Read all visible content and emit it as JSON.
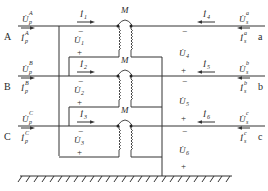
{
  "diagram": {
    "type": "three-phase coupled inductor circuit",
    "colors": {
      "line": "#333333",
      "text": "#2a2a2a",
      "background": "#ffffff"
    },
    "ports_left": [
      {
        "phase": "A",
        "voltage": "U̇",
        "voltage_sub": "p",
        "voltage_sup": "A",
        "current": "İ",
        "current_sub": "p",
        "current_sup": "A"
      },
      {
        "phase": "B",
        "voltage": "U̇",
        "voltage_sub": "p",
        "voltage_sup": "B",
        "current": "İ",
        "current_sub": "p",
        "current_sup": "B"
      },
      {
        "phase": "C",
        "voltage": "U̇",
        "voltage_sub": "p",
        "voltage_sup": "C",
        "current": "İ",
        "current_sub": "p",
        "current_sup": "C"
      }
    ],
    "ports_right": [
      {
        "phase": "a",
        "voltage": "U̇",
        "voltage_sub": "s",
        "voltage_sup": "a",
        "current": "İ",
        "current_sub": "s",
        "current_sup": "a"
      },
      {
        "phase": "b",
        "voltage": "U̇",
        "voltage_sub": "s",
        "voltage_sup": "b",
        "current": "İ",
        "current_sub": "s",
        "current_sup": "b"
      },
      {
        "phase": "c",
        "voltage": "U̇",
        "voltage_sub": "s",
        "voltage_sup": "c",
        "current": "İ",
        "current_sub": "s",
        "current_sup": "c"
      }
    ],
    "branch_currents": [
      {
        "name": "İ",
        "index": "1"
      },
      {
        "name": "İ",
        "index": "2"
      },
      {
        "name": "İ",
        "index": "3"
      },
      {
        "name": "İ",
        "index": "4"
      },
      {
        "name": "İ",
        "index": "5"
      },
      {
        "name": "İ",
        "index": "6"
      }
    ],
    "branch_voltages": [
      {
        "name": "U̇",
        "index": "1",
        "top_sign": "−",
        "bottom_sign": "+"
      },
      {
        "name": "U̇",
        "index": "2",
        "top_sign": "−",
        "bottom_sign": "+"
      },
      {
        "name": "U̇",
        "index": "3",
        "top_sign": "−",
        "bottom_sign": "+"
      },
      {
        "name": "U̇",
        "index": "4",
        "top_sign": "−",
        "bottom_sign": "+"
      },
      {
        "name": "U̇",
        "index": "5",
        "top_sign": "−",
        "bottom_sign": "+"
      },
      {
        "name": "U̇",
        "index": "6",
        "top_sign": "−",
        "bottom_sign": "+"
      }
    ],
    "mutual_label": "M",
    "plus": "+",
    "minus": "−"
  }
}
